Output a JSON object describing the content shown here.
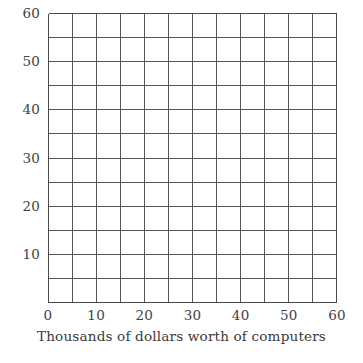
{
  "chart_data": {
    "type": "grid",
    "title": "",
    "subtitle": "",
    "xlabel": "Thousands of dollars worth of computers",
    "ylabel": "",
    "xlim": [
      0,
      60
    ],
    "ylim": [
      0,
      60
    ],
    "x_ticks": [
      0,
      10,
      20,
      30,
      40,
      50,
      60
    ],
    "y_ticks": [
      10,
      20,
      30,
      40,
      50,
      60
    ],
    "x_tick_labels": [
      "0",
      "10",
      "20",
      "30",
      "40",
      "50",
      "60"
    ],
    "y_tick_labels": [
      "10",
      "20",
      "30",
      "40",
      "50",
      "60"
    ],
    "origin_label": "0",
    "grid": true,
    "grid_step": 5,
    "grid_columns": 12,
    "grid_rows": 12,
    "legend": null,
    "series": [],
    "values": [],
    "annotations": [],
    "colors": {
      "background": "#ffffff",
      "grid_line": "#555555",
      "axis_line": "#4a4a4a",
      "text": "#3a3a3a"
    }
  },
  "axes": {
    "y": {
      "ticks": [
        {
          "label": "60",
          "value": 60
        },
        {
          "label": "50",
          "value": 50
        },
        {
          "label": "40",
          "value": 40
        },
        {
          "label": "30",
          "value": 30
        },
        {
          "label": "20",
          "value": 20
        },
        {
          "label": "10",
          "value": 10
        }
      ]
    },
    "x": {
      "ticks": [
        {
          "label": "0",
          "value": 0
        },
        {
          "label": "10",
          "value": 10
        },
        {
          "label": "20",
          "value": 20
        },
        {
          "label": "30",
          "value": 30
        },
        {
          "label": "40",
          "value": 40
        },
        {
          "label": "50",
          "value": 50
        },
        {
          "label": "60",
          "value": 60
        }
      ],
      "title": "Thousands of dollars worth of computers"
    }
  }
}
